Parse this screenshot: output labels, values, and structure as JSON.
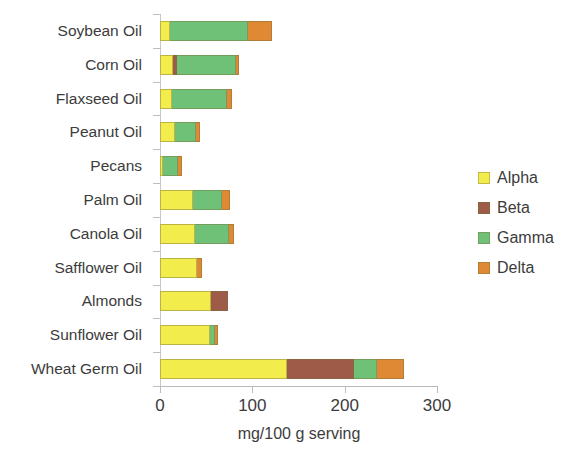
{
  "chart_data": {
    "type": "bar",
    "orientation": "horizontal",
    "stacked": true,
    "title": "",
    "xlabel": "mg/100 g serving",
    "ylabel": "",
    "xlim": [
      0,
      300
    ],
    "xticks": [
      0,
      100,
      200,
      300
    ],
    "xtick_labels": [
      "0",
      "100",
      "200",
      "300"
    ],
    "grid": false,
    "legend_position": "right",
    "categories": [
      "Soybean Oil",
      "Corn Oil",
      "Flaxseed Oil",
      "Peanut Oil",
      "Pecans",
      "Palm Oil",
      "Canola Oil",
      "Safflower Oil",
      "Almonds",
      "Sunflower Oil",
      "Wheat Germ Oil"
    ],
    "series": [
      {
        "name": "Alpha",
        "color": "#F2ED4C",
        "values": [
          11,
          14,
          13,
          16,
          3,
          36,
          38,
          40,
          55,
          54,
          138
        ]
      },
      {
        "name": "Beta",
        "color": "#9E5B48",
        "values": [
          0,
          4,
          0,
          0,
          0,
          0,
          0,
          0,
          19,
          0,
          72
        ]
      },
      {
        "name": "Gamma",
        "color": "#70C178",
        "values": [
          84,
          64,
          60,
          23,
          17,
          31,
          37,
          0,
          0,
          6,
          25
        ]
      },
      {
        "name": "Delta",
        "color": "#E08934",
        "values": [
          26,
          4,
          5,
          4,
          4,
          9,
          5,
          5,
          0,
          3,
          29
        ]
      }
    ]
  },
  "legend": {
    "items": [
      {
        "label": "Alpha",
        "color": "#F2ED4C"
      },
      {
        "label": "Beta",
        "color": "#9E5B48"
      },
      {
        "label": "Gamma",
        "color": "#70C178"
      },
      {
        "label": "Delta",
        "color": "#E08934"
      }
    ]
  }
}
